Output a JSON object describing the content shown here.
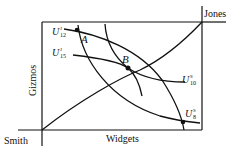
{
  "diagram": {
    "type": "edgeworth-box",
    "origins": {
      "bottom_left": "Smith",
      "top_right": "Jones"
    },
    "axes": {
      "horizontal": "Widgets",
      "vertical": "Gizmos"
    },
    "indifference_curves": {
      "jones": [
        {
          "base": "U",
          "sup": "J",
          "sub": "12"
        },
        {
          "base": "U",
          "sup": "J",
          "sub": "15"
        }
      ],
      "smith": [
        {
          "base": "U",
          "sup": "S",
          "sub": "10"
        },
        {
          "base": "U",
          "sup": "S",
          "sub": "8"
        }
      ]
    },
    "points": [
      {
        "label": "A",
        "description": "Initial allocation, intersection of U^J_12 and U^S_8"
      },
      {
        "label": "B",
        "description": "Tangency point on contract curve, U^J_15 and U^S_10"
      }
    ],
    "contract_curve": "Curve from Smith origin to Jones origin"
  }
}
